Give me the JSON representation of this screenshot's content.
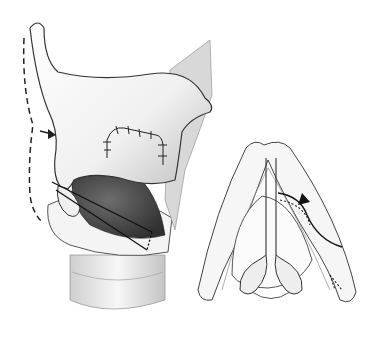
{
  "figure": {
    "panels": [
      {
        "name": "lateral-view",
        "elements": [
          "thyroid-cartilage",
          "sutured-window",
          "arrow",
          "dashed-outline",
          "suture-strands",
          "cricoid-cartilage",
          "trachea"
        ]
      },
      {
        "name": "superior-view",
        "elements": [
          "thyroid-ring",
          "vocal-folds",
          "arytenoid-cartilages",
          "direction-arrow",
          "dotted-path"
        ]
      }
    ],
    "colors": {
      "ink": "#222222",
      "shade": "#9a9a9a",
      "light": "#e8e8e8",
      "background": "#ffffff"
    }
  }
}
